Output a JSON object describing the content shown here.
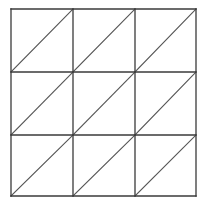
{
  "figure": {
    "name": "three-by-three-grid-of-diagonally-split-squares",
    "background_color": "#ffffff",
    "canvas": {
      "width": 207,
      "height": 207
    }
  },
  "chart_data": {
    "type": "diagram",
    "title": "",
    "subtitle": "",
    "xlabel": "",
    "ylabel": "",
    "grid": true,
    "legend": null,
    "annotations": [],
    "geometry": {
      "shape": "square-grid-with-diagonals",
      "rows": 3,
      "columns": 3,
      "cell_count": 9,
      "triangle_count": 18,
      "diagonal_direction": "bottom-left-to-top-right",
      "outer_square": {
        "x": 11,
        "y": 9,
        "width": 185,
        "height": 187
      },
      "x_gridlines": [
        11,
        73,
        135,
        196
      ],
      "y_gridlines": [
        9,
        72,
        135,
        196
      ],
      "cells": [
        {
          "row": 0,
          "col": 0,
          "x": 11,
          "y": 9,
          "w": 62,
          "h": 63,
          "diagonal": "/"
        },
        {
          "row": 0,
          "col": 1,
          "x": 73,
          "y": 9,
          "w": 62,
          "h": 63,
          "diagonal": "/"
        },
        {
          "row": 0,
          "col": 2,
          "x": 135,
          "y": 9,
          "w": 61,
          "h": 63,
          "diagonal": "/"
        },
        {
          "row": 1,
          "col": 0,
          "x": 11,
          "y": 72,
          "w": 62,
          "h": 63,
          "diagonal": "/"
        },
        {
          "row": 1,
          "col": 1,
          "x": 73,
          "y": 72,
          "w": 62,
          "h": 63,
          "diagonal": "/"
        },
        {
          "row": 1,
          "col": 2,
          "x": 135,
          "y": 72,
          "w": 61,
          "h": 63,
          "diagonal": "/"
        },
        {
          "row": 2,
          "col": 0,
          "x": 11,
          "y": 135,
          "w": 62,
          "h": 61,
          "diagonal": "/"
        },
        {
          "row": 2,
          "col": 1,
          "x": 73,
          "y": 135,
          "w": 62,
          "h": 61,
          "diagonal": "/"
        },
        {
          "row": 2,
          "col": 2,
          "x": 135,
          "y": 135,
          "w": 61,
          "h": 61,
          "diagonal": "/"
        }
      ]
    },
    "style": {
      "grid_line_color": "#3a3a3a",
      "grid_line_width": 1.3,
      "diagonal_line_color": "#555555",
      "diagonal_line_width": 1.1,
      "fill_color": "none"
    }
  }
}
